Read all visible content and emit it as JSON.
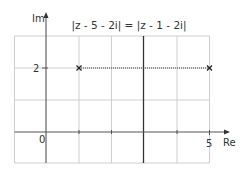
{
  "diagram": {
    "title": "|z - 5 - 2i| = |z - 1 - 2i|",
    "axes": {
      "x_label": "Re",
      "y_label": "Im",
      "origin_label": "0",
      "x_tick_label": "5",
      "y_tick_label": "2"
    },
    "points": [
      {
        "name": "point-1-2i",
        "re": 1,
        "im": 2,
        "marker": "x"
      },
      {
        "name": "point-5-2i",
        "re": 5,
        "im": 2,
        "marker": "x"
      }
    ],
    "segment": {
      "from": [
        1,
        2
      ],
      "to": [
        5,
        2
      ],
      "style": "dotted"
    },
    "locus": {
      "type": "vertical-line",
      "re": 3,
      "description": "perpendicular bisector Re(z) = 3"
    },
    "grid": {
      "x_range": [
        -1,
        5
      ],
      "y_range": [
        -1,
        3
      ],
      "spacing": 1
    },
    "colors": {
      "grid": "#cfcfcf",
      "axes": "#555555",
      "locus": "#333333",
      "text": "#333333"
    }
  }
}
